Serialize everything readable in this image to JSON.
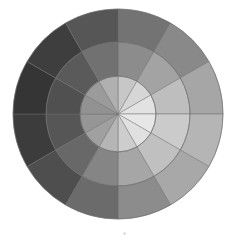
{
  "figure": {
    "background_color": "#ffffff",
    "center_x": 118,
    "center_y": 114,
    "outer_radius": 105,
    "middle_radius": 72,
    "inner_radius": 38,
    "sector_count": 12,
    "ring_count": 3,
    "sector_angle_degrees": 30,
    "start_angle_degrees": -90,
    "spoke_color": "#6b6b6b",
    "spoke_width": 0.45
  },
  "marker": {
    "name": "bottom-speck",
    "x": 124,
    "y": 233,
    "color": "#d8d8d8",
    "size": 3
  },
  "chart_data": {
    "type": "pie",
    "xlabel": "",
    "ylabel": "",
    "grid": false,
    "legend": "none",
    "note": "12 angular sectors x 3 concentric rings; luminance peaks toward the right/upper-right and falls off toward the left; inner ring lightest, outer ring darkest.",
    "categories": [
      "sector-01-top",
      "sector-02",
      "sector-03",
      "sector-04-right",
      "sector-05",
      "sector-06",
      "sector-07-bottom",
      "sector-08",
      "sector-09",
      "sector-10-left",
      "sector-11",
      "sector-12"
    ],
    "sector_start_angles": [
      -90,
      -60,
      -30,
      0,
      30,
      60,
      90,
      120,
      150,
      180,
      210,
      240
    ],
    "rings": [
      {
        "name": "inner",
        "inner_radius": 0,
        "outer_radius": 38,
        "values": [
          199,
          214,
          226,
          231,
          224,
          205,
          181,
          160,
          150,
          146,
          155,
          176
        ],
        "colors": [
          "#c7c7c7",
          "#d6d6d6",
          "#e2e2e2",
          "#e7e7e7",
          "#e0e0e0",
          "#cdcdcd",
          "#b5b5b5",
          "#a0a0a0",
          "#969696",
          "#929292",
          "#9b9b9b",
          "#b0b0b0"
        ]
      },
      {
        "name": "middle",
        "inner_radius": 38,
        "outer_radius": 72,
        "values": [
          140,
          163,
          190,
          203,
          192,
          166,
          133,
          104,
          86,
          80,
          90,
          113
        ],
        "colors": [
          "#8c8c8c",
          "#a3a3a3",
          "#bebebe",
          "#cbcbcb",
          "#c0c0c0",
          "#a6a6a6",
          "#858585",
          "#686868",
          "#565656",
          "#505050",
          "#5a5a5a",
          "#717171"
        ]
      },
      {
        "name": "outer",
        "inner_radius": 72,
        "outer_radius": 105,
        "values": [
          115,
          137,
          166,
          181,
          168,
          140,
          107,
          78,
          60,
          53,
          62,
          86
        ],
        "colors": [
          "#737373",
          "#898989",
          "#a6a6a6",
          "#b5b5b5",
          "#a8a8a8",
          "#8c8c8c",
          "#6b6b6b",
          "#4e4e4e",
          "#3c3c3c",
          "#353535",
          "#3e3e3e",
          "#565656"
        ]
      }
    ]
  }
}
